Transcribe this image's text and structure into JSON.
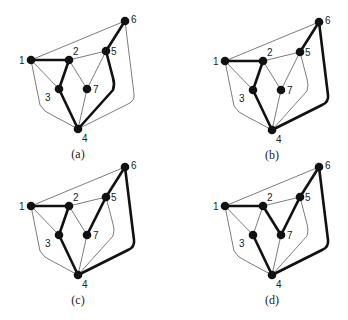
{
  "figure": {
    "panels": [
      {
        "id": "a",
        "caption": "(a)",
        "offset": [
          0,
          0
        ],
        "thick_edges": [
          [
            "1",
            "2"
          ],
          [
            "2",
            "3"
          ],
          [
            "3",
            "4"
          ],
          [
            "4",
            "5"
          ],
          [
            "5",
            "6"
          ]
        ],
        "thin_edges": [
          [
            "1",
            "6"
          ],
          [
            "1",
            "3"
          ],
          [
            "1",
            "4"
          ],
          [
            "2",
            "5"
          ],
          [
            "2",
            "7"
          ],
          [
            "5",
            "7"
          ],
          [
            "4",
            "7"
          ],
          [
            "4",
            "6"
          ]
        ]
      },
      {
        "id": "b",
        "caption": "(b)",
        "offset": [
          194,
          1
        ],
        "thick_edges": [
          [
            "1",
            "2"
          ],
          [
            "2",
            "3"
          ],
          [
            "3",
            "4"
          ],
          [
            "4",
            "6"
          ],
          [
            "6",
            "5"
          ]
        ],
        "thin_edges": [
          [
            "1",
            "6"
          ],
          [
            "1",
            "3"
          ],
          [
            "1",
            "4"
          ],
          [
            "2",
            "5"
          ],
          [
            "2",
            "7"
          ],
          [
            "5",
            "7"
          ],
          [
            "4",
            "5"
          ],
          [
            "4",
            "7"
          ]
        ]
      },
      {
        "id": "c",
        "caption": "(c)",
        "offset": [
          0,
          146
        ],
        "thick_edges": [
          [
            "1",
            "2"
          ],
          [
            "2",
            "3"
          ],
          [
            "3",
            "4"
          ],
          [
            "4",
            "6"
          ],
          [
            "6",
            "5"
          ],
          [
            "5",
            "7"
          ]
        ],
        "thin_edges": [
          [
            "1",
            "6"
          ],
          [
            "1",
            "3"
          ],
          [
            "1",
            "4"
          ],
          [
            "2",
            "5"
          ],
          [
            "2",
            "7"
          ],
          [
            "4",
            "5"
          ],
          [
            "4",
            "7"
          ]
        ]
      },
      {
        "id": "d",
        "caption": "(d)",
        "offset": [
          194,
          146
        ],
        "thick_edges": [
          [
            "1",
            "2"
          ],
          [
            "2",
            "7"
          ],
          [
            "7",
            "5"
          ],
          [
            "5",
            "6"
          ],
          [
            "6",
            "4"
          ],
          [
            "4",
            "3"
          ]
        ],
        "thin_edges": [
          [
            "1",
            "6"
          ],
          [
            "1",
            "3"
          ],
          [
            "1",
            "4"
          ],
          [
            "2",
            "5"
          ],
          [
            "2",
            "3"
          ],
          [
            "4",
            "5"
          ],
          [
            "4",
            "7"
          ]
        ]
      }
    ],
    "node_labels": [
      "1",
      "2",
      "3",
      "4",
      "5",
      "6",
      "7"
    ]
  }
}
